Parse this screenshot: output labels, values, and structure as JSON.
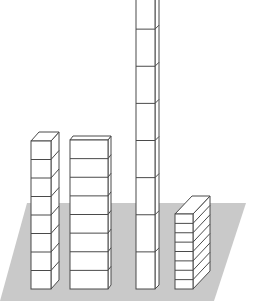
{
  "diagram": {
    "colors": {
      "platform": "#c9c9c9",
      "block_fill": "#ffffff",
      "block_edge": "#4a4a4a",
      "background": "#ffffff"
    },
    "platform": {
      "points": [
        [
          27,
          203
        ],
        [
          246,
          203
        ],
        [
          214,
          301
        ],
        [
          0,
          301
        ]
      ]
    },
    "stacks": [
      {
        "id": "stack-1",
        "label": "narrow cube stack",
        "blocks": 8,
        "front_x": 31,
        "front_w": 20,
        "top_y": 141,
        "bottom_y": 289,
        "dx": 8,
        "dy": -9
      },
      {
        "id": "stack-2",
        "label": "wide flat stack",
        "blocks": 8,
        "front_x": 70,
        "front_w": 38,
        "top_y": 140,
        "bottom_y": 289,
        "dx": 3,
        "dy": -4
      },
      {
        "id": "stack-3",
        "label": "tall rod stack",
        "blocks": 8,
        "front_x": 136,
        "front_w": 19,
        "top_y": -8,
        "bottom_y": 289,
        "dx": 4,
        "dy": -4,
        "clipped_top": true
      },
      {
        "id": "stack-4",
        "label": "thin layered stack",
        "blocks": 8,
        "front_x": 175,
        "front_w": 18,
        "top_y": 214,
        "bottom_y": 289,
        "dx": 17,
        "dy": -18
      }
    ]
  }
}
